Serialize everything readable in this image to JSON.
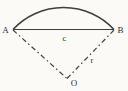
{
  "diagram": {
    "type": "circular-sector",
    "labels": {
      "point_a": "A",
      "point_b": "B",
      "center": "O",
      "chord": "c",
      "radius": "r"
    },
    "colors": {
      "line": "#3f3f3f",
      "text": "#2e2e2e",
      "background": "#fbfaf7"
    }
  }
}
